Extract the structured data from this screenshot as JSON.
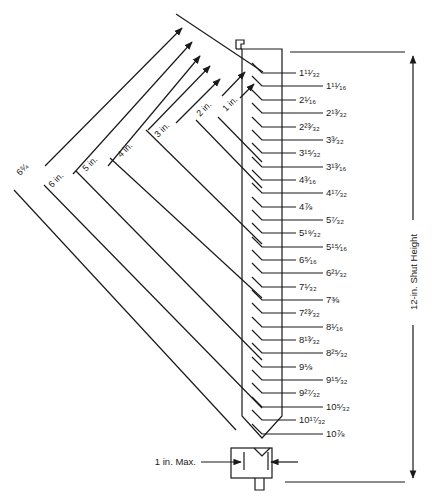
{
  "diagram": {
    "shut_height_label": "12-in. Shut Height",
    "max_label": "1 in. Max.",
    "diagonal_dimensions": [
      {
        "label": "1 in.",
        "id": "dim-1in"
      },
      {
        "label": "2 in.",
        "id": "dim-2in"
      },
      {
        "label": "3 in.",
        "id": "dim-3in"
      },
      {
        "label": "4 in.",
        "id": "dim-4in"
      },
      {
        "label": "5 in.",
        "id": "dim-5in"
      },
      {
        "label": "6 in.",
        "id": "dim-6in"
      },
      {
        "label": "6¾",
        "id": "dim-6-3-4"
      }
    ],
    "scale_marks": [
      {
        "label": "1¹¹⁄₃₂",
        "y": 73,
        "long": false
      },
      {
        "label": "1¹¹⁄₁₆",
        "y": 86,
        "long": true
      },
      {
        "label": "2¹⁄₁₆",
        "y": 100,
        "long": false
      },
      {
        "label": "2¹³⁄₃₂",
        "y": 113,
        "long": true
      },
      {
        "label": "2²³⁄₃₂",
        "y": 127,
        "long": false
      },
      {
        "label": "3³⁄₃₂",
        "y": 140,
        "long": true
      },
      {
        "label": "3¹⁵⁄₃₂",
        "y": 153,
        "long": false
      },
      {
        "label": "3¹³⁄₁₆",
        "y": 167,
        "long": true
      },
      {
        "label": "4³⁄₁₆",
        "y": 180,
        "long": false
      },
      {
        "label": "4¹⁷⁄₃₂",
        "y": 193,
        "long": true
      },
      {
        "label": "4⅞",
        "y": 207,
        "long": false
      },
      {
        "label": "5⁷⁄₃₂",
        "y": 220,
        "long": true
      },
      {
        "label": "5¹⁹⁄₃₂",
        "y": 233,
        "long": false
      },
      {
        "label": "5¹⁵⁄₁₆",
        "y": 247,
        "long": true
      },
      {
        "label": "6⁵⁄₁₆",
        "y": 260,
        "long": false
      },
      {
        "label": "6²¹⁄₃₂",
        "y": 273,
        "long": true
      },
      {
        "label": "7¹⁄₃₂",
        "y": 287,
        "long": false
      },
      {
        "label": "7⅜",
        "y": 300,
        "long": true
      },
      {
        "label": "7²³⁄₃₂",
        "y": 313,
        "long": false
      },
      {
        "label": "8¹⁄₁₆",
        "y": 327,
        "long": true
      },
      {
        "label": "8¹³⁄₃₂",
        "y": 340,
        "long": false
      },
      {
        "label": "8²⁵⁄₃₂",
        "y": 353,
        "long": true
      },
      {
        "label": "9⅛",
        "y": 367,
        "long": false
      },
      {
        "label": "9¹⁵⁄₃₂",
        "y": 380,
        "long": true
      },
      {
        "label": "9²⁷⁄₃₂",
        "y": 393,
        "long": false
      },
      {
        "label": "10⁵⁄₃₂",
        "y": 407,
        "long": true
      },
      {
        "label": "10¹⁷⁄₃₂",
        "y": 420,
        "long": false
      },
      {
        "label": "10⅞",
        "y": 434,
        "long": true
      }
    ]
  }
}
